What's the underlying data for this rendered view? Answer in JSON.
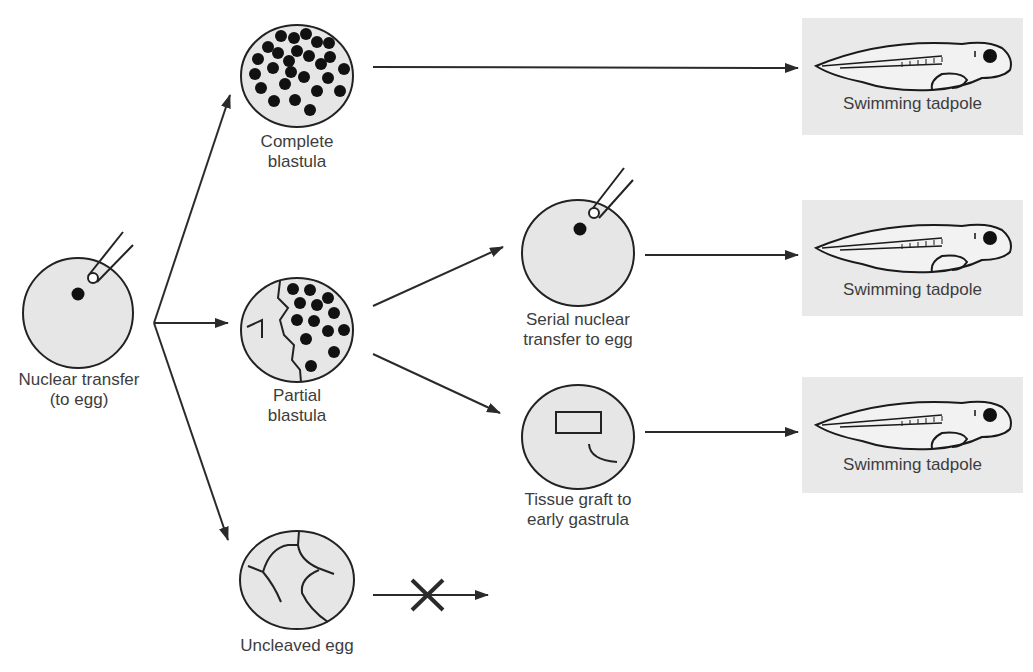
{
  "figure": {
    "type": "nuclear-transfer-experiment-flowchart",
    "colors": {
      "cell_fill": "#e6e6e6",
      "outline": "#222222",
      "tadpole_box": "#e9e9e9",
      "text": "#3d3d3d"
    }
  },
  "nodes": {
    "start": {
      "label": "Nuclear transfer\n(to egg)"
    },
    "complete_blastula": {
      "label": "Complete\nblastula"
    },
    "partial_blastula": {
      "label": "Partial\nblastula"
    },
    "uncleaved_egg": {
      "label": "Uncleaved egg"
    },
    "serial_transfer": {
      "label": "Serial nuclear\ntransfer to egg"
    },
    "tissue_graft": {
      "label": "Tissue graft to\nearly gastrula"
    }
  },
  "outcomes": [
    {
      "label": "Swimming tadpole"
    },
    {
      "label": "Swimming tadpole"
    },
    {
      "label": "Swimming tadpole"
    }
  ],
  "blocked_arrow": {
    "symbol": "X",
    "meaning": "no development"
  }
}
